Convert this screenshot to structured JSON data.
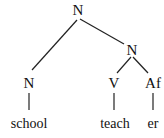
{
  "tree": {
    "root": {
      "label": "N"
    },
    "right_n": {
      "label": "N"
    },
    "left_n": {
      "label": "N"
    },
    "v": {
      "label": "V"
    },
    "af": {
      "label": "Af"
    }
  },
  "words": {
    "school": "school",
    "teach": "teach",
    "er": "er"
  }
}
